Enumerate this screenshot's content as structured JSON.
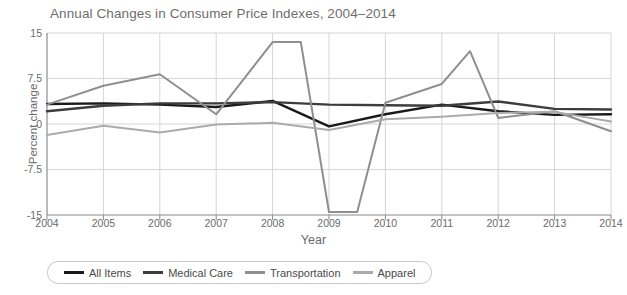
{
  "chart_data": {
    "type": "line",
    "title": "Annual Changes in Consumer Price Indexes, 2004–2014",
    "xlabel": "Year",
    "ylabel": "Percent change",
    "grid": true,
    "legend_position": "bottom",
    "xlim": [
      2004,
      2014
    ],
    "ylim": [
      -15,
      15
    ],
    "xticks": [
      "2004",
      "2005",
      "2006",
      "2007",
      "2008",
      "2009",
      "2010",
      "2011",
      "2012",
      "2013",
      "2014"
    ],
    "yticks": [
      "15",
      "7.5",
      "0",
      "-7.5",
      "-15"
    ],
    "x": [
      2004,
      2005,
      2006,
      2007,
      2008,
      2009,
      2010,
      2011,
      2012,
      2013,
      2014
    ],
    "series": [
      {
        "name": "All Items",
        "color": "#1a1a1a",
        "values": [
          3.3,
          3.4,
          3.2,
          2.8,
          3.8,
          -0.4,
          1.6,
          3.2,
          2.1,
          1.5,
          1.6
        ]
      },
      {
        "name": "Medical Care",
        "color": "#3d3d3d",
        "values": [
          2.1,
          3.0,
          3.4,
          3.4,
          3.6,
          3.2,
          3.1,
          3.0,
          3.7,
          2.5,
          2.4
        ]
      },
      {
        "name": "Transportation",
        "color": "#8f8f8f",
        "values": [
          3.2,
          6.3,
          8.2,
          1.6,
          13.5,
          -14.5,
          3.5,
          6.6,
          1.0,
          2.1,
          -1.2
        ]
      },
      {
        "name": "Apparel",
        "color": "#ababab",
        "values": [
          -1.8,
          -0.3,
          -1.4,
          -0.1,
          0.2,
          -1.0,
          0.8,
          1.2,
          1.8,
          2.0,
          0.4
        ]
      }
    ],
    "annotations": [
      {
        "label": "Transportation 2008.5 peak",
        "x": 2008.5,
        "y": 13.5
      },
      {
        "label": "Transportation 2009.5 trough",
        "x": 2009.5,
        "y": -14.5
      },
      {
        "label": "Transportation 2011.5 peak",
        "x": 2011.5,
        "y": 12.0
      }
    ]
  },
  "legend": {
    "items": [
      {
        "label": "All Items"
      },
      {
        "label": "Medical Care"
      },
      {
        "label": "Transportation"
      },
      {
        "label": "Apparel"
      }
    ]
  }
}
